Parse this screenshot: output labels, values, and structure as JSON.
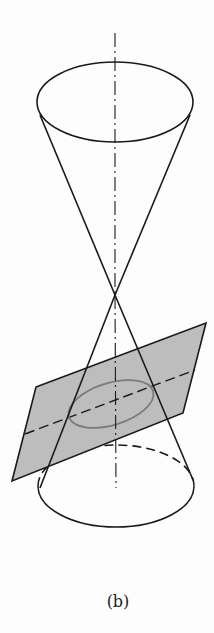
{
  "figure": {
    "label": "(b)",
    "colors": {
      "line": "#1a1a1a",
      "plane_fill": "#bdbdbd",
      "ellipse_section": "#7a7a7a",
      "background": "#fdfdfd"
    }
  }
}
